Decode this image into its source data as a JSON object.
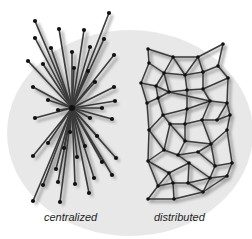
{
  "figure": {
    "colors": {
      "background": "#ffffff",
      "ellipse": "#e8e8e8",
      "edge": "#3a3a3a",
      "node": "#111111",
      "shadow": "#9a9a9a"
    },
    "ellipse": {
      "cx": 130,
      "cy": 133,
      "rx": 123,
      "ry": 103
    }
  },
  "centralized": {
    "label": "centralized",
    "label_pos": {
      "x": 44,
      "y": 211
    },
    "hub": [
      72,
      108
    ],
    "nodes": [
      [
        35,
        21
      ],
      [
        109,
        13
      ],
      [
        59,
        29
      ],
      [
        84,
        30
      ],
      [
        35,
        38
      ],
      [
        51,
        48
      ],
      [
        104,
        39
      ],
      [
        90,
        47
      ],
      [
        72,
        52
      ],
      [
        28,
        61
      ],
      [
        43,
        64
      ],
      [
        114,
        55
      ],
      [
        74,
        68
      ],
      [
        88,
        71
      ],
      [
        95,
        82
      ],
      [
        33,
        87
      ],
      [
        114,
        87
      ],
      [
        48,
        100
      ],
      [
        115,
        101
      ],
      [
        58,
        110
      ],
      [
        102,
        108
      ],
      [
        35,
        118
      ],
      [
        90,
        118
      ],
      [
        112,
        119
      ],
      [
        70,
        132
      ],
      [
        97,
        136
      ],
      [
        48,
        143
      ],
      [
        64,
        148
      ],
      [
        85,
        146
      ],
      [
        33,
        156
      ],
      [
        77,
        157
      ],
      [
        116,
        158
      ],
      [
        102,
        162
      ],
      [
        56,
        169
      ],
      [
        112,
        175
      ],
      [
        94,
        178
      ],
      [
        58,
        182
      ],
      [
        75,
        184
      ],
      [
        43,
        185
      ],
      [
        89,
        193
      ],
      [
        33,
        201
      ],
      [
        60,
        202
      ]
    ]
  },
  "distributed": {
    "label": "distributed",
    "label_pos": {
      "x": 154,
      "y": 211
    },
    "nodes": [
      [
        148,
        49
      ],
      [
        173,
        57
      ],
      [
        198,
        57
      ],
      [
        223,
        44
      ],
      [
        149,
        63
      ],
      [
        164,
        73
      ],
      [
        185,
        75
      ],
      [
        203,
        72
      ],
      [
        218,
        66
      ],
      [
        141,
        83
      ],
      [
        156,
        86
      ],
      [
        169,
        92
      ],
      [
        187,
        90
      ],
      [
        203,
        89
      ],
      [
        228,
        78
      ],
      [
        147,
        103
      ],
      [
        158,
        98
      ],
      [
        187,
        109
      ],
      [
        210,
        101
      ],
      [
        227,
        103
      ],
      [
        163,
        115
      ],
      [
        202,
        120
      ],
      [
        217,
        120
      ],
      [
        230,
        115
      ],
      [
        170,
        124
      ],
      [
        185,
        124
      ],
      [
        227,
        130
      ],
      [
        149,
        130
      ],
      [
        185,
        141
      ],
      [
        211,
        144
      ],
      [
        164,
        150
      ],
      [
        178,
        155
      ],
      [
        198,
        152
      ],
      [
        148,
        161
      ],
      [
        189,
        163
      ],
      [
        215,
        166
      ],
      [
        232,
        163
      ],
      [
        169,
        173
      ],
      [
        210,
        178
      ],
      [
        227,
        176
      ],
      [
        158,
        186
      ],
      [
        173,
        183
      ],
      [
        188,
        183
      ],
      [
        203,
        192
      ],
      [
        148,
        199
      ],
      [
        174,
        199
      ]
    ],
    "edges": [
      [
        0,
        1
      ],
      [
        1,
        2
      ],
      [
        2,
        3
      ],
      [
        0,
        4
      ],
      [
        3,
        8
      ],
      [
        1,
        5
      ],
      [
        1,
        6
      ],
      [
        2,
        6
      ],
      [
        2,
        7
      ],
      [
        4,
        5
      ],
      [
        5,
        6
      ],
      [
        6,
        7
      ],
      [
        7,
        8
      ],
      [
        4,
        9
      ],
      [
        5,
        10
      ],
      [
        5,
        11
      ],
      [
        6,
        12
      ],
      [
        7,
        13
      ],
      [
        8,
        14
      ],
      [
        9,
        10
      ],
      [
        10,
        11
      ],
      [
        11,
        12
      ],
      [
        12,
        13
      ],
      [
        13,
        14
      ],
      [
        9,
        15
      ],
      [
        10,
        16
      ],
      [
        11,
        16
      ],
      [
        12,
        17
      ],
      [
        13,
        18
      ],
      [
        14,
        19
      ],
      [
        11,
        18
      ],
      [
        15,
        16
      ],
      [
        16,
        20
      ],
      [
        17,
        20
      ],
      [
        17,
        18
      ],
      [
        18,
        19
      ],
      [
        18,
        21
      ],
      [
        19,
        22
      ],
      [
        19,
        23
      ],
      [
        20,
        24
      ],
      [
        17,
        25
      ],
      [
        21,
        22
      ],
      [
        22,
        23
      ],
      [
        23,
        26
      ],
      [
        15,
        27
      ],
      [
        20,
        27
      ],
      [
        24,
        25
      ],
      [
        25,
        21
      ],
      [
        24,
        28
      ],
      [
        25,
        28
      ],
      [
        21,
        29
      ],
      [
        26,
        29
      ],
      [
        28,
        29
      ],
      [
        27,
        30
      ],
      [
        24,
        30
      ],
      [
        30,
        31
      ],
      [
        28,
        31
      ],
      [
        31,
        32
      ],
      [
        29,
        32
      ],
      [
        27,
        33
      ],
      [
        30,
        33
      ],
      [
        31,
        34
      ],
      [
        32,
        35
      ],
      [
        29,
        35
      ],
      [
        26,
        36
      ],
      [
        35,
        36
      ],
      [
        33,
        37
      ],
      [
        34,
        37
      ],
      [
        34,
        38
      ],
      [
        35,
        38
      ],
      [
        36,
        39
      ],
      [
        38,
        39
      ],
      [
        37,
        40
      ],
      [
        37,
        41
      ],
      [
        41,
        42
      ],
      [
        34,
        42
      ],
      [
        42,
        43
      ],
      [
        38,
        43
      ],
      [
        40,
        44
      ],
      [
        41,
        45
      ],
      [
        43,
        45
      ],
      [
        44,
        45
      ],
      [
        40,
        41
      ],
      [
        39,
        43
      ],
      [
        33,
        40
      ],
      [
        42,
        38
      ]
    ]
  }
}
